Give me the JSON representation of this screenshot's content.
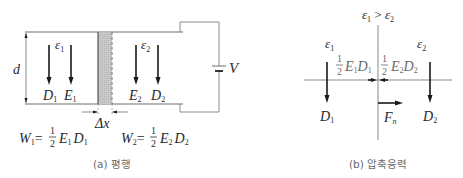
{
  "figure": {
    "panel_a": {
      "caption": "(a) 평행",
      "dimension_label": "d",
      "voltage_label": "V",
      "gap_label": "Δx",
      "region1": {
        "permittivity": "ε",
        "permittivity_sub": "1",
        "arrows": [
          {
            "label": "D",
            "sub": "1"
          },
          {
            "label": "E",
            "sub": "1"
          }
        ],
        "energy_formula": {
          "lhs": "W",
          "lhs_sub": "1",
          "eq": "=",
          "frac_num": "1",
          "frac_den": "2",
          "t1": "E",
          "t1_sub": "1",
          "t2": "D",
          "t2_sub": "1"
        }
      },
      "region2": {
        "permittivity": "ε",
        "permittivity_sub": "2",
        "arrows": [
          {
            "label": "E",
            "sub": "2"
          },
          {
            "label": "D",
            "sub": "2"
          }
        ],
        "energy_formula": {
          "lhs": "W",
          "lhs_sub": "2",
          "eq": "=",
          "frac_num": "1",
          "frac_den": "2",
          "t1": "E",
          "t1_sub": "2",
          "t2": "D",
          "t2_sub": "2"
        }
      }
    },
    "panel_b": {
      "caption": "(b) 압축응력",
      "condition": {
        "a": "ε",
        "a_sub": "1",
        "op": " > ",
        "b": "ε",
        "b_sub": "2"
      },
      "left": {
        "permittivity": "ε",
        "permittivity_sub": "1",
        "field": "D",
        "field_sub": "1",
        "pressure": {
          "frac_num": "1",
          "frac_den": "2",
          "t1": "E",
          "t1_sub": "1",
          "t2": "D",
          "t2_sub": "1"
        }
      },
      "right": {
        "permittivity": "ε",
        "permittivity_sub": "2",
        "field": "D",
        "field_sub": "2",
        "pressure": {
          "frac_num": "1",
          "frac_den": "2",
          "t1": "E",
          "t1_sub": "2",
          "t2": "D",
          "t2_sub": "2"
        }
      },
      "force": {
        "label": "F",
        "sub": "n"
      }
    }
  }
}
